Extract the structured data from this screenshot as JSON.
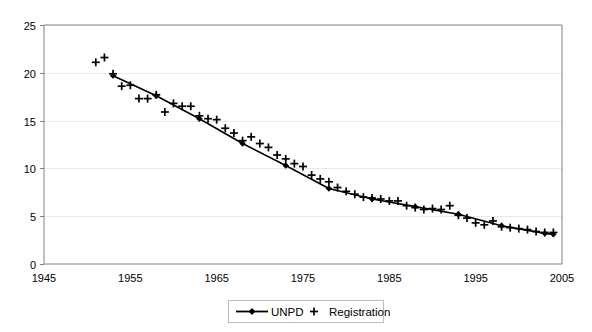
{
  "chart_data": {
    "type": "line",
    "title": "",
    "xlabel": "",
    "ylabel": "",
    "xlim": [
      1945,
      2005
    ],
    "ylim": [
      0,
      25
    ],
    "xticks": [
      1945,
      1955,
      1965,
      1975,
      1985,
      1995,
      2005
    ],
    "yticks": [
      0,
      5,
      10,
      15,
      20,
      25
    ],
    "grid": "horizontal",
    "legend_position": "bottom-center",
    "series": [
      {
        "name": "UNPD",
        "marker": "diamond",
        "line": true,
        "color": "#000000",
        "points": [
          [
            1953,
            19.7
          ],
          [
            1958,
            17.6
          ],
          [
            1963,
            15.2
          ],
          [
            1968,
            12.6
          ],
          [
            1973,
            10.3
          ],
          [
            1978,
            7.9
          ],
          [
            1983,
            6.8
          ],
          [
            1988,
            6.0
          ],
          [
            1993,
            5.2
          ],
          [
            1998,
            4.0
          ],
          [
            2003,
            3.2
          ],
          [
            2004,
            3.1
          ]
        ]
      },
      {
        "name": "Registration",
        "marker": "plus",
        "line": false,
        "color": "#000000",
        "points": [
          [
            1951,
            21.1
          ],
          [
            1952,
            21.6
          ],
          [
            1953,
            19.9
          ],
          [
            1954,
            18.6
          ],
          [
            1955,
            18.7
          ],
          [
            1956,
            17.3
          ],
          [
            1957,
            17.3
          ],
          [
            1958,
            17.7
          ],
          [
            1959,
            15.9
          ],
          [
            1960,
            16.8
          ],
          [
            1961,
            16.5
          ],
          [
            1962,
            16.5
          ],
          [
            1963,
            15.5
          ],
          [
            1964,
            15.2
          ],
          [
            1965,
            15.1
          ],
          [
            1966,
            14.2
          ],
          [
            1967,
            13.7
          ],
          [
            1968,
            12.9
          ],
          [
            1969,
            13.3
          ],
          [
            1970,
            12.6
          ],
          [
            1971,
            12.2
          ],
          [
            1972,
            11.4
          ],
          [
            1973,
            11.0
          ],
          [
            1974,
            10.5
          ],
          [
            1975,
            10.2
          ],
          [
            1976,
            9.3
          ],
          [
            1977,
            8.9
          ],
          [
            1978,
            8.6
          ],
          [
            1979,
            8.0
          ],
          [
            1980,
            7.6
          ],
          [
            1981,
            7.3
          ],
          [
            1982,
            7.0
          ],
          [
            1983,
            6.9
          ],
          [
            1984,
            6.8
          ],
          [
            1985,
            6.6
          ],
          [
            1986,
            6.6
          ],
          [
            1987,
            6.1
          ],
          [
            1988,
            5.9
          ],
          [
            1989,
            5.7
          ],
          [
            1990,
            5.8
          ],
          [
            1991,
            5.7
          ],
          [
            1992,
            6.1
          ],
          [
            1993,
            5.1
          ],
          [
            1994,
            4.8
          ],
          [
            1995,
            4.3
          ],
          [
            1996,
            4.1
          ],
          [
            1997,
            4.5
          ],
          [
            1998,
            3.9
          ],
          [
            1999,
            3.8
          ],
          [
            2000,
            3.7
          ],
          [
            2001,
            3.6
          ],
          [
            2002,
            3.4
          ],
          [
            2003,
            3.3
          ],
          [
            2004,
            3.3
          ]
        ]
      }
    ]
  },
  "axes": {
    "y_tick_labels": [
      "0",
      "5",
      "10",
      "15",
      "20",
      "25"
    ],
    "x_tick_labels": [
      "1945",
      "1955",
      "1965",
      "1975",
      "1985",
      "1995",
      "2005"
    ]
  },
  "legend": {
    "entries": [
      {
        "label": "UNPD",
        "marker": "line-diamond-marker"
      },
      {
        "label": "Registration",
        "marker": "plus-marker"
      }
    ]
  },
  "colors": {
    "series": "#000000",
    "gridline": "#e8e8e8",
    "axis": "#808080",
    "background": "#ffffff",
    "legend_border": "#bdbdbd"
  }
}
